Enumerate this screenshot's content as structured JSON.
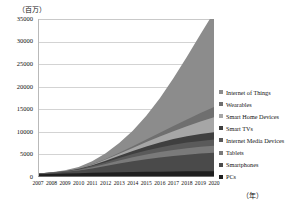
{
  "axes": {
    "y_unit_label": "（百万）",
    "x_unit_label": "（年）",
    "y_ticks": [
      "0",
      "5000",
      "10000",
      "15000",
      "20000",
      "25000",
      "30000",
      "35000"
    ],
    "x_ticks": [
      "2007",
      "2008",
      "2009",
      "2010",
      "2011",
      "2012",
      "2013",
      "2014",
      "2015",
      "2016",
      "2017",
      "2018",
      "2019",
      "2020"
    ]
  },
  "legend": {
    "items": [
      {
        "label": "Internet of Things",
        "color": "#8c8c8c"
      },
      {
        "label": "Wearables",
        "color": "#6f6f6f"
      },
      {
        "label": "Smart Home Devices",
        "color": "#a6a6a6"
      },
      {
        "label": "Smart TVs",
        "color": "#3f3f3f"
      },
      {
        "label": "Internet Media Devices",
        "color": "#5a5a5a"
      },
      {
        "label": "Tablets",
        "color": "#7a7a7a"
      },
      {
        "label": "Smartphones",
        "color": "#4a4a4a"
      },
      {
        "label": "PCs",
        "color": "#1f1f1f"
      }
    ]
  },
  "chart_data": {
    "type": "area",
    "title": "",
    "xlabel": "（年）",
    "ylabel": "（百万）",
    "ylim": [
      0,
      35000
    ],
    "grid": true,
    "legend_position": "right",
    "stacked": true,
    "categories": [
      "2007",
      "2008",
      "2009",
      "2010",
      "2011",
      "2012",
      "2013",
      "2014",
      "2015",
      "2016",
      "2017",
      "2018",
      "2019",
      "2020"
    ],
    "series": [
      {
        "name": "PCs",
        "color": "#1f1f1f",
        "values": [
          600,
          680,
          760,
          840,
          920,
          990,
          1050,
          1100,
          1150,
          1190,
          1225,
          1255,
          1280,
          1300
        ]
      },
      {
        "name": "Smartphones",
        "color": "#4a4a4a",
        "values": [
          120,
          220,
          380,
          620,
          980,
          1450,
          1950,
          2400,
          2800,
          3150,
          3450,
          3700,
          3900,
          4050
        ]
      },
      {
        "name": "Tablets",
        "color": "#7a7a7a",
        "values": [
          10,
          20,
          40,
          110,
          260,
          450,
          650,
          850,
          1050,
          1200,
          1320,
          1420,
          1500,
          1560
        ]
      },
      {
        "name": "Internet Media Devices",
        "color": "#5a5a5a",
        "values": [
          20,
          40,
          80,
          150,
          260,
          400,
          560,
          720,
          880,
          1020,
          1140,
          1240,
          1320,
          1380
        ]
      },
      {
        "name": "Smart TVs",
        "color": "#3f3f3f",
        "values": [
          5,
          15,
          40,
          90,
          180,
          320,
          500,
          700,
          900,
          1090,
          1260,
          1400,
          1520,
          1610
        ]
      },
      {
        "name": "Smart Home Devices",
        "color": "#a6a6a6",
        "values": [
          5,
          10,
          25,
          60,
          130,
          250,
          420,
          650,
          950,
          1320,
          1760,
          2250,
          2780,
          3320
        ]
      },
      {
        "name": "Wearables",
        "color": "#6f6f6f",
        "values": [
          2,
          5,
          12,
          30,
          70,
          140,
          250,
          400,
          600,
          850,
          1150,
          1500,
          1880,
          2280
        ]
      },
      {
        "name": "Internet of Things",
        "color": "#8c8c8c",
        "values": [
          30,
          70,
          160,
          340,
          680,
          1250,
          2150,
          3450,
          5250,
          7600,
          10550,
          13900,
          17450,
          21000
        ]
      }
    ],
    "total_by_year": [
      792,
      1060,
      1497,
      2240,
      3480,
      5250,
      7530,
      10270,
      13580,
      17420,
      21855,
      26665,
      31630,
      36500
    ]
  }
}
